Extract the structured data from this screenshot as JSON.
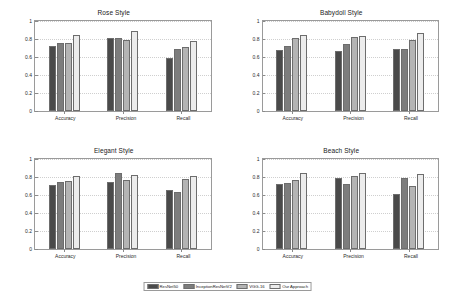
{
  "chart_data": {
    "type": "bar",
    "title": "",
    "categories": [
      "Accuracy",
      "Precision",
      "Recall"
    ],
    "ylabel": "",
    "xlabel": "",
    "ylim": [
      0,
      1
    ],
    "yticks": [
      "0",
      "0.2",
      "0.4",
      "0.6",
      "0.8",
      "1"
    ],
    "ytick_values": [
      0,
      0.2,
      0.4,
      0.6,
      0.8,
      1
    ],
    "grid": true,
    "legend_position": "bottom-center",
    "series_names": [
      "ResNet50",
      "InceptionResNetV2",
      "VGG-16",
      "Our Approach"
    ],
    "series_colors": [
      "#4a4a4a",
      "#7d7d7d",
      "#b4b4b4",
      "#ececec"
    ],
    "panels": [
      {
        "title": "Rose Style",
        "series": [
          {
            "name": "ResNet50",
            "values": [
              0.72,
              0.81,
              0.59
            ]
          },
          {
            "name": "InceptionResNetV2",
            "values": [
              0.76,
              0.81,
              0.69
            ]
          },
          {
            "name": "VGG-16",
            "values": [
              0.76,
              0.79,
              0.71
            ]
          },
          {
            "name": "Our Approach",
            "values": [
              0.84,
              0.89,
              0.78
            ]
          }
        ]
      },
      {
        "title": "Babydoll Style",
        "series": [
          {
            "name": "ResNet50",
            "values": [
              0.68,
              0.67,
              0.69
            ]
          },
          {
            "name": "InceptionResNetV2",
            "values": [
              0.72,
              0.75,
              0.69
            ]
          },
          {
            "name": "VGG-16",
            "values": [
              0.81,
              0.82,
              0.79
            ]
          },
          {
            "name": "Our Approach",
            "values": [
              0.84,
              0.83,
              0.87
            ]
          }
        ]
      },
      {
        "title": "Elegant Style",
        "series": [
          {
            "name": "ResNet50",
            "values": [
              0.71,
              0.74,
              0.66
            ]
          },
          {
            "name": "InceptionResNetV2",
            "values": [
              0.75,
              0.85,
              0.63
            ]
          },
          {
            "name": "VGG-16",
            "values": [
              0.76,
              0.77,
              0.78
            ]
          },
          {
            "name": "Our Approach",
            "values": [
              0.81,
              0.82,
              0.81
            ]
          }
        ]
      },
      {
        "title": "Beach Style",
        "series": [
          {
            "name": "ResNet50",
            "values": [
              0.72,
              0.79,
              0.61
            ]
          },
          {
            "name": "InceptionResNetV2",
            "values": [
              0.73,
              0.72,
              0.79
            ]
          },
          {
            "name": "VGG-16",
            "values": [
              0.77,
              0.81,
              0.7
            ]
          },
          {
            "name": "Our Approach",
            "values": [
              0.84,
              0.85,
              0.83
            ]
          }
        ]
      }
    ]
  },
  "legend": {
    "entries": [
      {
        "label": "ResNet50",
        "color": "#4a4a4a"
      },
      {
        "label": "InceptionResNetV2",
        "color": "#7d7d7d"
      },
      {
        "label": "VGG-16",
        "color": "#b4b4b4"
      },
      {
        "label": "Our Approach",
        "color": "#ececec"
      }
    ]
  }
}
